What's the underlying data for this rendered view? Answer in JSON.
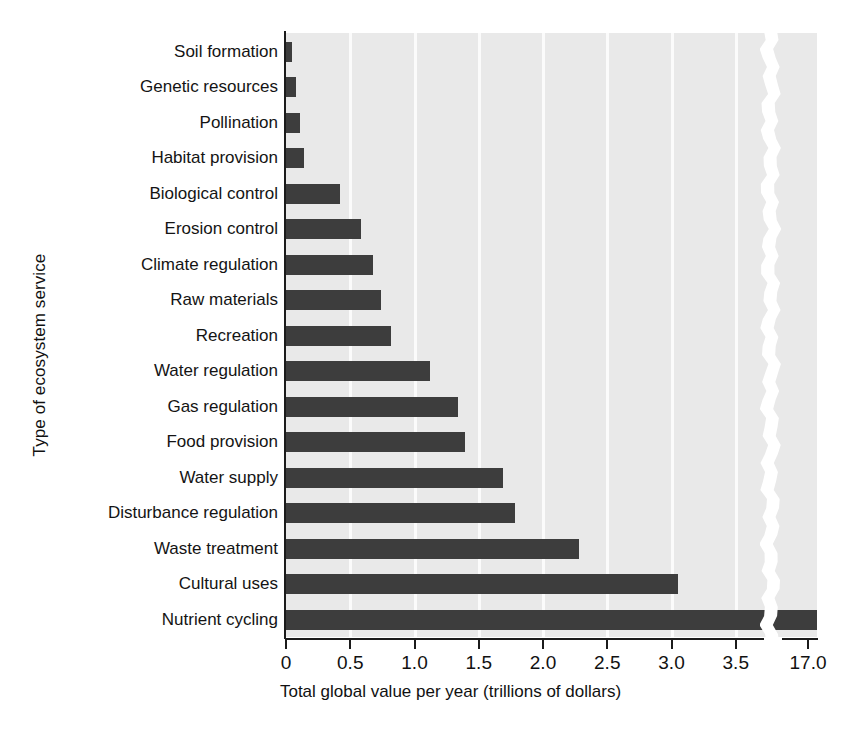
{
  "chart_data": {
    "type": "bar",
    "orientation": "horizontal",
    "title": "",
    "xlabel": "Total global value per year (trillions of dollars)",
    "ylabel": "Type of ecosystem service",
    "categories": [
      "Soil formation",
      "Genetic resources",
      "Pollination",
      "Habitat provision",
      "Biological control",
      "Erosion control",
      "Climate regulation",
      "Raw materials",
      "Recreation",
      "Water regulation",
      "Gas regulation",
      "Food provision",
      "Water supply",
      "Disturbance regulation",
      "Waste treatment",
      "Cultural uses",
      "Nutrient cycling"
    ],
    "values": [
      0.05,
      0.08,
      0.11,
      0.14,
      0.42,
      0.58,
      0.68,
      0.74,
      0.82,
      1.12,
      1.34,
      1.39,
      1.69,
      1.78,
      2.28,
      3.05,
      17.08
    ],
    "xticks": [
      0,
      0.5,
      1.0,
      1.5,
      2.0,
      2.5,
      3.0,
      3.5,
      17.0
    ],
    "xtick_labels": [
      "0",
      "0.5",
      "1.0",
      "1.5",
      "2.0",
      "2.5",
      "3.0",
      "3.5",
      "17.0"
    ],
    "axis_break": true,
    "axis_break_note": "x-axis broken between 3.5 and 17.0",
    "xlim": [
      0,
      3.7
    ],
    "grid": "vertical white gridlines at each tick",
    "legend": "none",
    "colors": {
      "bar": "#3d3d3d",
      "plot_background": "#e9e9e9",
      "gridline": "#fbfbfb",
      "axis": "#1b1b1b",
      "text": "#141414",
      "page_background": "#ffffff"
    }
  }
}
